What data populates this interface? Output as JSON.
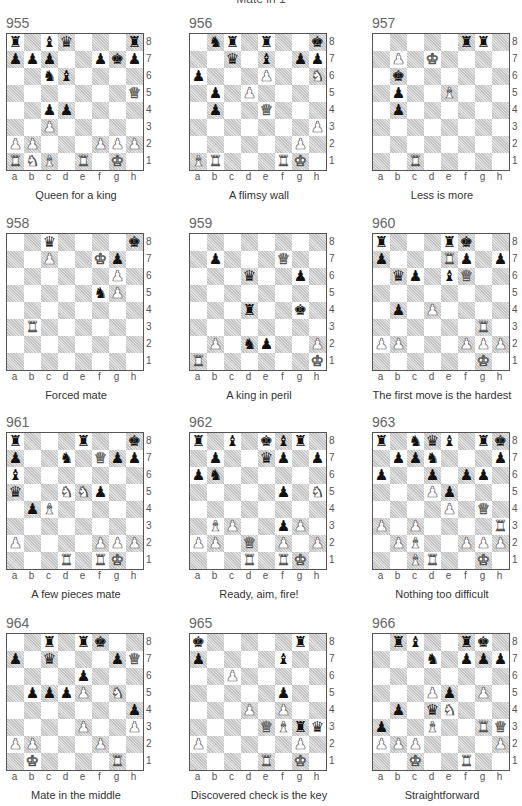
{
  "header": {
    "title": "Mate in 1"
  },
  "files": [
    "a",
    "b",
    "c",
    "d",
    "e",
    "f",
    "g",
    "h"
  ],
  "ranks": [
    "8",
    "7",
    "6",
    "5",
    "4",
    "3",
    "2",
    "1"
  ],
  "puzzles": [
    {
      "number": "955",
      "caption": "Queen for a king",
      "position": [
        [
          "bR",
          "",
          "bB",
          "bQ",
          "",
          "",
          "",
          "bR"
        ],
        [
          "bP",
          "bP",
          "bP",
          "",
          "",
          "bP",
          "bK",
          "bP"
        ],
        [
          "",
          "",
          "bN",
          "bB",
          "",
          "",
          "",
          ""
        ],
        [
          "",
          "",
          "",
          "",
          "",
          "",
          "",
          "wQ"
        ],
        [
          "",
          "",
          "bP",
          "bP",
          "",
          "",
          "",
          ""
        ],
        [
          "",
          "",
          "wP",
          "",
          "",
          "",
          "",
          ""
        ],
        [
          "wP",
          "wP",
          "",
          "",
          "",
          "wP",
          "wP",
          "wP"
        ],
        [
          "wR",
          "wN",
          "wB",
          "",
          "wR",
          "",
          "wK",
          ""
        ]
      ]
    },
    {
      "number": "956",
      "caption": "A flimsy wall",
      "position": [
        [
          "",
          "bN",
          "bR",
          "",
          "bR",
          "",
          "",
          "bK"
        ],
        [
          "",
          "",
          "bQ",
          "",
          "bB",
          "",
          "bP",
          "bP"
        ],
        [
          "bP",
          "",
          "",
          "",
          "wP",
          "",
          "",
          "wN"
        ],
        [
          "",
          "bP",
          "",
          "wP",
          "",
          "",
          "",
          ""
        ],
        [
          "",
          "bP",
          "",
          "",
          "wQ",
          "",
          "",
          ""
        ],
        [
          "",
          "",
          "",
          "",
          "",
          "",
          "",
          "wP"
        ],
        [
          "",
          "",
          "",
          "",
          "",
          "",
          "wP",
          ""
        ],
        [
          "wB",
          "wR",
          "",
          "",
          "",
          "wR",
          "wK",
          ""
        ]
      ]
    },
    {
      "number": "957",
      "caption": "Less is more",
      "position": [
        [
          "",
          "",
          "",
          "",
          "",
          "bR",
          "bR",
          ""
        ],
        [
          "",
          "wP",
          "",
          "wK",
          "",
          "",
          "",
          ""
        ],
        [
          "",
          "bK",
          "",
          "",
          "",
          "",
          "",
          ""
        ],
        [
          "",
          "bP",
          "",
          "",
          "wB",
          "",
          "",
          ""
        ],
        [
          "",
          "bP",
          "",
          "",
          "",
          "",
          "",
          ""
        ],
        [
          "",
          "",
          "",
          "",
          "",
          "",
          "",
          ""
        ],
        [
          "",
          "",
          "",
          "",
          "",
          "",
          "",
          ""
        ],
        [
          "",
          "",
          "wR",
          "",
          "",
          "",
          "",
          ""
        ]
      ]
    },
    {
      "number": "958",
      "caption": "Forced mate",
      "position": [
        [
          "",
          "",
          "bQ",
          "",
          "",
          "",
          "",
          "bK"
        ],
        [
          "",
          "",
          "wP",
          "",
          "",
          "wK",
          "bP",
          ""
        ],
        [
          "",
          "",
          "",
          "",
          "",
          "",
          "wP",
          ""
        ],
        [
          "",
          "",
          "",
          "",
          "",
          "bN",
          "wP",
          ""
        ],
        [
          "",
          "",
          "",
          "",
          "",
          "",
          "",
          ""
        ],
        [
          "",
          "wR",
          "",
          "",
          "",
          "",
          "",
          ""
        ],
        [
          "",
          "",
          "",
          "",
          "",
          "",
          "",
          ""
        ],
        [
          "",
          "",
          "",
          "",
          "",
          "",
          "",
          ""
        ]
      ]
    },
    {
      "number": "959",
      "caption": "A king in peril",
      "position": [
        [
          "",
          "",
          "",
          "",
          "",
          "",
          "",
          ""
        ],
        [
          "",
          "bP",
          "",
          "",
          "",
          "wQ",
          "",
          ""
        ],
        [
          "",
          "",
          "",
          "bQ",
          "",
          "",
          "bP",
          ""
        ],
        [
          "",
          "",
          "",
          "",
          "",
          "",
          "",
          ""
        ],
        [
          "",
          "",
          "",
          "bR",
          "",
          "",
          "bK",
          ""
        ],
        [
          "",
          "",
          "",
          "",
          "",
          "",
          "",
          ""
        ],
        [
          "",
          "wP",
          "",
          "bN",
          "bP",
          "",
          "",
          "wP"
        ],
        [
          "wR",
          "",
          "",
          "",
          "",
          "",
          "",
          "wK"
        ]
      ]
    },
    {
      "number": "960",
      "caption": "The first move is the hardest",
      "position": [
        [
          "bR",
          "",
          "",
          "",
          "bR",
          "bK",
          "",
          ""
        ],
        [
          "bP",
          "",
          "",
          "",
          "wR",
          "bP",
          "",
          "bP"
        ],
        [
          "",
          "bQ",
          "bP",
          "",
          "bB",
          "wQ",
          "",
          ""
        ],
        [
          "",
          "",
          "",
          "",
          "",
          "",
          "",
          ""
        ],
        [
          "",
          "bP",
          "",
          "wP",
          "",
          "",
          "",
          ""
        ],
        [
          "",
          "",
          "",
          "",
          "",
          "",
          "wR",
          ""
        ],
        [
          "wP",
          "wP",
          "",
          "",
          "",
          "wP",
          "wP",
          "wP"
        ],
        [
          "",
          "",
          "",
          "",
          "",
          "",
          "wK",
          ""
        ]
      ]
    },
    {
      "number": "961",
      "caption": "A few pieces mate",
      "position": [
        [
          "bR",
          "",
          "",
          "",
          "bR",
          "",
          "",
          "bK"
        ],
        [
          "bP",
          "",
          "",
          "bN",
          "",
          "wQ",
          "bP",
          "bP"
        ],
        [
          "bB",
          "",
          "",
          "",
          "",
          "",
          "",
          ""
        ],
        [
          "bQ",
          "",
          "",
          "wN",
          "wN",
          "bP",
          "",
          ""
        ],
        [
          "",
          "bP",
          "wB",
          "",
          "",
          "",
          "",
          ""
        ],
        [
          "",
          "",
          "",
          "",
          "",
          "",
          "",
          ""
        ],
        [
          "wP",
          "",
          "",
          "",
          "",
          "wP",
          "wP",
          "wP"
        ],
        [
          "",
          "",
          "",
          "wR",
          "",
          "wR",
          "wK",
          ""
        ]
      ]
    },
    {
      "number": "962",
      "caption": "Ready, aim, fire!",
      "position": [
        [
          "bR",
          "",
          "bB",
          "",
          "bK",
          "bB",
          "bR",
          ""
        ],
        [
          "",
          "bP",
          "",
          "",
          "bQ",
          "bP",
          "",
          "bP"
        ],
        [
          "bP",
          "bN",
          "",
          "",
          "",
          "",
          "",
          ""
        ],
        [
          "",
          "",
          "",
          "",
          "",
          "bP",
          "",
          "wN"
        ],
        [
          "",
          "",
          "",
          "",
          "",
          "",
          "",
          ""
        ],
        [
          "",
          "wB",
          "wP",
          "",
          "",
          "bP",
          "wP",
          ""
        ],
        [
          "wP",
          "wP",
          "",
          "wQ",
          "",
          "wP",
          "",
          "wP"
        ],
        [
          "",
          "",
          "",
          "wR",
          "",
          "wR",
          "wK",
          ""
        ]
      ]
    },
    {
      "number": "963",
      "caption": "Nothing too difficult",
      "position": [
        [
          "bR",
          "",
          "bN",
          "bQ",
          "bB",
          "",
          "bR",
          "bK"
        ],
        [
          "",
          "bP",
          "bP",
          "bN",
          "",
          "",
          "",
          "bP"
        ],
        [
          "bP",
          "",
          "",
          "bP",
          "",
          "bP",
          "bP",
          ""
        ],
        [
          "",
          "",
          "",
          "wP",
          "bP",
          "",
          "",
          ""
        ],
        [
          "",
          "",
          "",
          "",
          "wP",
          "",
          "wQ",
          ""
        ],
        [
          "wP",
          "",
          "wP",
          "",
          "",
          "",
          "",
          "wR"
        ],
        [
          "",
          "wP",
          "wB",
          "",
          "",
          "wP",
          "wP",
          "wP"
        ],
        [
          "",
          "",
          "wB",
          "wR",
          "",
          "",
          "wK",
          ""
        ]
      ]
    },
    {
      "number": "964",
      "caption": "Mate in the middle",
      "position": [
        [
          "",
          "",
          "bR",
          "",
          "bR",
          "bK",
          "",
          ""
        ],
        [
          "bP",
          "",
          "bQ",
          "",
          "",
          "",
          "bP",
          "wQ"
        ],
        [
          "",
          "",
          "",
          "",
          "bP",
          "",
          "",
          ""
        ],
        [
          "",
          "bP",
          "bP",
          "bP",
          "wP",
          "",
          "wN",
          ""
        ],
        [
          "",
          "",
          "",
          "",
          "",
          "",
          "",
          "bP"
        ],
        [
          "",
          "",
          "",
          "",
          "wP",
          "",
          "",
          "wP"
        ],
        [
          "wP",
          "wP",
          "",
          "",
          "",
          "wP",
          "",
          ""
        ],
        [
          "",
          "wK",
          "",
          "",
          "",
          "",
          "wR",
          ""
        ]
      ]
    },
    {
      "number": "965",
      "caption": "Discovered check is the key",
      "position": [
        [
          "bK",
          "",
          "",
          "",
          "",
          "",
          "bR",
          ""
        ],
        [
          "bP",
          "",
          "",
          "",
          "",
          "bB",
          "",
          ""
        ],
        [
          "",
          "",
          "wP",
          "",
          "",
          "",
          "",
          ""
        ],
        [
          "",
          "",
          "",
          "",
          "",
          "bP",
          "",
          ""
        ],
        [
          "",
          "",
          "",
          "wP",
          "",
          "wP",
          "",
          ""
        ],
        [
          "",
          "",
          "",
          "",
          "wQ",
          "wB",
          "bR",
          "bQ"
        ],
        [
          "wP",
          "",
          "",
          "",
          "",
          "",
          "wP",
          ""
        ],
        [
          "",
          "",
          "",
          "",
          "wR",
          "",
          "wK",
          ""
        ]
      ]
    },
    {
      "number": "966",
      "caption": "Straightforward",
      "position": [
        [
          "",
          "bR",
          "bB",
          "",
          "",
          "bR",
          "bK",
          ""
        ],
        [
          "",
          "",
          "",
          "bN",
          "",
          "bP",
          "bP",
          "bP"
        ],
        [
          "",
          "",
          "",
          "",
          "",
          "",
          "",
          ""
        ],
        [
          "",
          "",
          "",
          "wP",
          "bP",
          "",
          "wP",
          ""
        ],
        [
          "",
          "bP",
          "",
          "bQ",
          "wN",
          "",
          "",
          ""
        ],
        [
          "bP",
          "",
          "",
          "wB",
          "",
          "",
          "wR",
          "wQ"
        ],
        [
          "wP",
          "wP",
          "wP",
          "",
          "",
          "",
          "",
          "wP"
        ],
        [
          "",
          "",
          "wK",
          "",
          "",
          "wR",
          "",
          ""
        ]
      ]
    }
  ],
  "glyphs": {
    "K": "♚",
    "Q": "♛",
    "R": "♜",
    "B": "♝",
    "N": "♞",
    "P": "♟",
    "wK": "♔",
    "wQ": "♕",
    "wR": "♖",
    "wB": "♗",
    "wN": "♘",
    "wP": "♙"
  },
  "colors": {
    "dark_square": "#cccccc",
    "light_square": "#ffffff",
    "border": "#555555"
  }
}
